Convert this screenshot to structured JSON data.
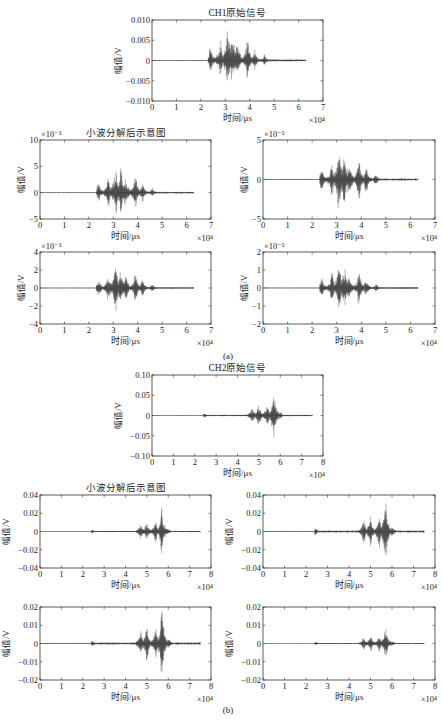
{
  "figure": {
    "subcaptions": [
      "(a)",
      "(b)"
    ]
  },
  "chart_data": [
    {
      "id": "a-orig",
      "type": "line",
      "title": "CH1原始信号",
      "xlabel": "时间/μs",
      "ylabel": "幅值/V",
      "x_multiplier": "×10⁴",
      "y_multiplier": "",
      "xlim": [
        0,
        7
      ],
      "ylim": [
        -0.01,
        0.01
      ],
      "xticks": [
        "0",
        "1",
        "2",
        "3",
        "4",
        "5",
        "6",
        "7"
      ],
      "yticks": [
        "-0.010",
        "-0.005",
        "0",
        "0.005",
        "0.010"
      ],
      "signal": {
        "start": 2.3,
        "end": 6.3,
        "bursts": [
          [
            2.4,
            0.35
          ],
          [
            2.8,
            0.5
          ],
          [
            3.1,
            0.9
          ],
          [
            3.3,
            0.75
          ],
          [
            3.5,
            0.5
          ],
          [
            3.9,
            0.55
          ],
          [
            4.2,
            0.3
          ],
          [
            4.6,
            0.15
          ]
        ],
        "peak_pos": 0.0085,
        "peak_neg": -0.0065
      },
      "box": {
        "x": 152,
        "y": 20,
        "w": 171,
        "h": 81
      }
    },
    {
      "id": "a-d1",
      "type": "line",
      "title": "小波分解后示意图",
      "xlabel": "时间/μs",
      "ylabel": "幅值/V",
      "x_multiplier": "×10⁴",
      "y_multiplier": "×10⁻³",
      "xlim": [
        0,
        7
      ],
      "ylim": [
        -5,
        10
      ],
      "xticks": [
        "0",
        "1",
        "2",
        "3",
        "4",
        "5",
        "6",
        "7"
      ],
      "yticks": [
        "-5",
        "0",
        "5",
        "10"
      ],
      "signal": {
        "start": 2.3,
        "end": 6.3,
        "bursts": [
          [
            2.4,
            0.35
          ],
          [
            2.8,
            0.5
          ],
          [
            3.1,
            0.9
          ],
          [
            3.3,
            0.75
          ],
          [
            3.5,
            0.5
          ],
          [
            3.9,
            0.55
          ],
          [
            4.2,
            0.3
          ],
          [
            4.6,
            0.15
          ]
        ],
        "peak_pos": 5,
        "peak_neg": -4.5
      },
      "box": {
        "x": 40,
        "y": 140,
        "w": 171,
        "h": 79
      }
    },
    {
      "id": "a-d2",
      "type": "line",
      "title": "",
      "xlabel": "时间/μs",
      "ylabel": "幅值/V",
      "x_multiplier": "×10⁴",
      "y_multiplier": "×10⁻³",
      "xlim": [
        0,
        7
      ],
      "ylim": [
        -5,
        5
      ],
      "xticks": [
        "0",
        "1",
        "2",
        "3",
        "4",
        "5",
        "6",
        "7"
      ],
      "yticks": [
        "-5",
        "0",
        "5"
      ],
      "signal": {
        "start": 2.3,
        "end": 6.3,
        "bursts": [
          [
            2.4,
            0.35
          ],
          [
            2.8,
            0.5
          ],
          [
            3.1,
            0.95
          ],
          [
            3.3,
            0.7
          ],
          [
            3.5,
            0.5
          ],
          [
            3.9,
            0.55
          ],
          [
            4.2,
            0.35
          ],
          [
            4.6,
            0.15
          ]
        ],
        "peak_pos": 3.7,
        "peak_neg": -4.2
      },
      "box": {
        "x": 263,
        "y": 140,
        "w": 172,
        "h": 79
      }
    },
    {
      "id": "a-d3",
      "type": "line",
      "title": "",
      "xlabel": "时间/μs",
      "ylabel": "幅值/V",
      "x_multiplier": "×10⁴",
      "y_multiplier": "×10⁻³",
      "xlim": [
        0,
        7
      ],
      "ylim": [
        -4,
        4
      ],
      "xticks": [
        "0",
        "1",
        "2",
        "3",
        "4",
        "5",
        "6",
        "7"
      ],
      "yticks": [
        "-4",
        "-2",
        "0",
        "2",
        "4"
      ],
      "signal": {
        "start": 2.3,
        "end": 6.3,
        "bursts": [
          [
            2.4,
            0.35
          ],
          [
            2.8,
            0.5
          ],
          [
            3.1,
            0.9
          ],
          [
            3.3,
            0.7
          ],
          [
            3.5,
            0.5
          ],
          [
            3.9,
            0.55
          ],
          [
            4.2,
            0.3
          ],
          [
            4.6,
            0.15
          ]
        ],
        "peak_pos": 2.5,
        "peak_neg": -2.5
      },
      "box": {
        "x": 40,
        "y": 252,
        "w": 171,
        "h": 72
      }
    },
    {
      "id": "a-d4",
      "type": "line",
      "title": "",
      "xlabel": "时间/μs",
      "ylabel": "幅值/V",
      "x_multiplier": "×10⁴",
      "y_multiplier": "×10⁻³",
      "xlim": [
        0,
        7
      ],
      "ylim": [
        -2,
        2
      ],
      "xticks": [
        "0",
        "1",
        "2",
        "3",
        "4",
        "5",
        "6",
        "7"
      ],
      "yticks": [
        "-2",
        "-1",
        "0",
        "1",
        "2"
      ],
      "signal": {
        "start": 2.3,
        "end": 6.3,
        "bursts": [
          [
            2.4,
            0.35
          ],
          [
            2.8,
            0.5
          ],
          [
            3.1,
            0.9
          ],
          [
            3.3,
            0.75
          ],
          [
            3.5,
            0.5
          ],
          [
            3.9,
            0.6
          ],
          [
            4.2,
            0.3
          ],
          [
            4.6,
            0.15
          ]
        ],
        "peak_pos": 1.4,
        "peak_neg": -1.3
      },
      "box": {
        "x": 263,
        "y": 252,
        "w": 172,
        "h": 72
      }
    },
    {
      "id": "b-orig",
      "type": "line",
      "title": "CH2原始信号",
      "xlabel": "时间/μs",
      "ylabel": "幅值/V",
      "x_multiplier": "×10⁴",
      "y_multiplier": "",
      "xlim": [
        0,
        8
      ],
      "ylim": [
        -0.1,
        0.1
      ],
      "xticks": [
        "0",
        "1",
        "2",
        "3",
        "4",
        "5",
        "6",
        "7",
        "8"
      ],
      "yticks": [
        "-0.10",
        "-0.05",
        "0",
        "0.05",
        "0.10"
      ],
      "signal": {
        "start": 2.4,
        "end": 7.5,
        "bursts": [
          [
            2.45,
            0.08
          ],
          [
            4.7,
            0.35
          ],
          [
            5.0,
            0.45
          ],
          [
            5.4,
            0.5
          ],
          [
            5.7,
            1.0
          ],
          [
            6.0,
            0.15
          ]
        ],
        "peak_pos": 0.055,
        "peak_neg": -0.055
      },
      "box": {
        "x": 152,
        "y": 375,
        "w": 171,
        "h": 81
      }
    },
    {
      "id": "b-d1",
      "type": "line",
      "title": "小波分解后示意图",
      "xlabel": "时间/μs",
      "ylabel": "幅值/V",
      "x_multiplier": "×10⁴",
      "y_multiplier": "",
      "xlim": [
        0,
        8
      ],
      "ylim": [
        -0.04,
        0.04
      ],
      "xticks": [
        "0",
        "1",
        "2",
        "3",
        "4",
        "5",
        "6",
        "7",
        "8"
      ],
      "yticks": [
        "-0.04",
        "-0.02",
        "0",
        "0.02",
        "0.04"
      ],
      "signal": {
        "start": 2.4,
        "end": 7.5,
        "bursts": [
          [
            2.45,
            0.08
          ],
          [
            4.7,
            0.35
          ],
          [
            5.0,
            0.45
          ],
          [
            5.4,
            0.5
          ],
          [
            5.7,
            1.0
          ],
          [
            6.0,
            0.15
          ]
        ],
        "peak_pos": 0.022,
        "peak_neg": -0.022
      },
      "box": {
        "x": 40,
        "y": 495,
        "w": 171,
        "h": 73
      }
    },
    {
      "id": "b-d2",
      "type": "line",
      "title": "",
      "xlabel": "时间/μs",
      "ylabel": "幅值/V",
      "x_multiplier": "×10⁴",
      "y_multiplier": "",
      "xlim": [
        0,
        8
      ],
      "ylim": [
        -0.04,
        0.04
      ],
      "xticks": [
        "0",
        "1",
        "2",
        "3",
        "4",
        "5",
        "6",
        "7",
        "8"
      ],
      "yticks": [
        "-0.04",
        "-0.02",
        "0",
        "0.02",
        "0.04"
      ],
      "signal": {
        "start": 2.4,
        "end": 7.5,
        "bursts": [
          [
            2.45,
            0.1
          ],
          [
            4.7,
            0.35
          ],
          [
            5.0,
            0.4
          ],
          [
            5.4,
            0.45
          ],
          [
            5.7,
            1.0
          ],
          [
            6.0,
            0.15
          ]
        ],
        "peak_pos": 0.034,
        "peak_neg": -0.035
      },
      "box": {
        "x": 263,
        "y": 495,
        "w": 172,
        "h": 73
      }
    },
    {
      "id": "b-d3",
      "type": "line",
      "title": "",
      "xlabel": "时间/μs",
      "ylabel": "幅值/V",
      "x_multiplier": "×10⁴",
      "y_multiplier": "",
      "xlim": [
        0,
        8
      ],
      "ylim": [
        -0.02,
        0.02
      ],
      "xticks": [
        "0",
        "1",
        "2",
        "3",
        "4",
        "5",
        "6",
        "7",
        "8"
      ],
      "yticks": [
        "-0.02",
        "-0.01",
        "0",
        "0.01",
        "0.02"
      ],
      "signal": {
        "start": 2.4,
        "end": 7.5,
        "bursts": [
          [
            2.45,
            0.08
          ],
          [
            4.7,
            0.35
          ],
          [
            5.0,
            0.45
          ],
          [
            5.4,
            0.5
          ],
          [
            5.7,
            1.0
          ],
          [
            6.0,
            0.15
          ]
        ],
        "peak_pos": 0.018,
        "peak_neg": -0.018
      },
      "box": {
        "x": 40,
        "y": 607,
        "w": 171,
        "h": 73
      }
    },
    {
      "id": "b-d4",
      "type": "line",
      "title": "",
      "xlabel": "时间/μs",
      "ylabel": "幅值/V",
      "x_multiplier": "×10⁴",
      "y_multiplier": "",
      "xlim": [
        0,
        8
      ],
      "ylim": [
        -0.02,
        0.02
      ],
      "xticks": [
        "0",
        "1",
        "2",
        "3",
        "4",
        "5",
        "6",
        "7",
        "8"
      ],
      "yticks": [
        "-0.02",
        "-0.01",
        "0",
        "0.01",
        "0.02"
      ],
      "signal": {
        "start": 2.4,
        "end": 7.5,
        "bursts": [
          [
            2.45,
            0.1
          ],
          [
            4.7,
            0.35
          ],
          [
            5.0,
            0.45
          ],
          [
            5.4,
            0.45
          ],
          [
            5.7,
            1.0
          ],
          [
            6.0,
            0.15
          ]
        ],
        "peak_pos": 0.009,
        "peak_neg": -0.009
      },
      "box": {
        "x": 263,
        "y": 607,
        "w": 172,
        "h": 73
      }
    }
  ]
}
